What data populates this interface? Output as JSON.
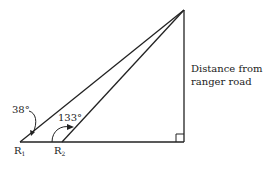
{
  "diagram": {
    "type": "right-triangle-geometry",
    "points": {
      "R1": {
        "label": "R",
        "sub": "1"
      },
      "R2": {
        "label": "R",
        "sub": "2"
      }
    },
    "angles": {
      "at_R1": "38°",
      "at_R2": "133°"
    },
    "side_label_line1": "Distance from",
    "side_label_line2": "ranger road",
    "right_angle_marker": true,
    "stroke_color": "#222222"
  }
}
